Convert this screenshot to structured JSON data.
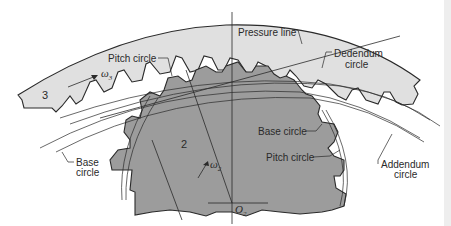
{
  "diagram": {
    "colors": {
      "background": "#ffffff",
      "gear3_fill": "#e0e0e0",
      "gear2_fill": "#9c9c9c",
      "line": "#2a2a2a",
      "edge_strip": "#eeeeee"
    },
    "gears": [
      {
        "id": "3",
        "label": "3",
        "angular_velocity_symbol": "ω",
        "angular_velocity_subscript": "3"
      },
      {
        "id": "2",
        "label": "2",
        "angular_velocity_symbol": "ω",
        "angular_velocity_subscript": "2",
        "center_symbol": "O",
        "center_subscript": "2"
      }
    ],
    "labels": {
      "pitch_circle_top": "Pitch circle",
      "pressure_line": "Pressure line",
      "dedendum_circle_line1": "Dedendum",
      "dedendum_circle_line2": "circle",
      "base_circle_left_line1": "Base",
      "base_circle_left_line2": "circle",
      "base_circle_right": "Base circle",
      "pitch_circle_right": "Pitch circle",
      "addendum_circle_line1": "Addendum",
      "addendum_circle_line2": "circle"
    }
  }
}
